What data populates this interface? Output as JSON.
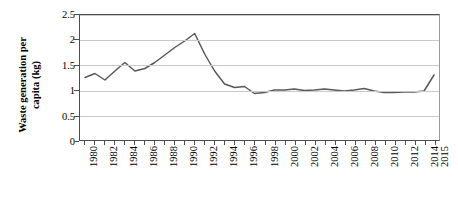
{
  "chart_data": {
    "type": "line",
    "title": "",
    "xlabel": "",
    "ylabel": "Waste generation per capita (kg)",
    "ylabel_lines": [
      "Waste generation per",
      "capita (kg)"
    ],
    "ylim": [
      0,
      2.5
    ],
    "yticks": [
      "0",
      "0.5",
      "1",
      "1.5",
      "2",
      "2.5"
    ],
    "ytick_values": [
      0,
      0.5,
      1,
      1.5,
      2,
      2.5
    ],
    "grid": true,
    "grid_axis": "y",
    "legend": false,
    "legend_position": "none",
    "line_color": "#595959",
    "xtick_labels": [
      "1980",
      "1982",
      "1984",
      "1986",
      "1988",
      "1990",
      "1992",
      "1994",
      "1996",
      "1998",
      "2000",
      "2002",
      "2004",
      "2006",
      "2008",
      "2010",
      "2012",
      "2014",
      "2015"
    ],
    "x": [
      1980,
      1981,
      1982,
      1983,
      1984,
      1985,
      1986,
      1987,
      1988,
      1989,
      1990,
      1991,
      1992,
      1993,
      1994,
      1995,
      1996,
      1997,
      1998,
      1999,
      2000,
      2001,
      2002,
      2003,
      2004,
      2005,
      2006,
      2007,
      2008,
      2009,
      2010,
      2011,
      2012,
      2013,
      2014,
      2015
    ],
    "values": [
      1.25,
      1.33,
      1.2,
      1.38,
      1.55,
      1.38,
      1.43,
      1.55,
      1.7,
      1.85,
      1.98,
      2.13,
      1.72,
      1.38,
      1.12,
      1.05,
      1.07,
      0.93,
      0.95,
      1.0,
      1.0,
      1.02,
      0.99,
      1.0,
      1.02,
      1.0,
      0.98,
      1.0,
      1.03,
      0.98,
      0.95,
      0.95,
      0.96,
      0.96,
      0.98,
      1.3
    ],
    "series": [
      {
        "name": "Waste generation per capita (kg)",
        "values": [
          1.25,
          1.33,
          1.2,
          1.38,
          1.55,
          1.38,
          1.43,
          1.55,
          1.7,
          1.85,
          1.98,
          2.13,
          1.72,
          1.38,
          1.12,
          1.05,
          1.07,
          0.93,
          0.95,
          1.0,
          1.0,
          1.02,
          0.99,
          1.0,
          1.02,
          1.0,
          0.98,
          1.0,
          1.03,
          0.98,
          0.95,
          0.95,
          0.96,
          0.96,
          0.98,
          1.3
        ]
      }
    ]
  }
}
